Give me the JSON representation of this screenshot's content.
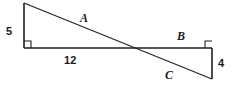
{
  "figure": {
    "type": "geometry-diagram",
    "background_color": "#ffffff",
    "stroke_color": "#231f20",
    "label_color": "#1a1a1a",
    "width": 237,
    "height": 88,
    "labels": {
      "leg_left": "5",
      "base": "12",
      "leg_right": "4",
      "side_a": "A",
      "side_b": "B",
      "side_c": "C"
    },
    "geometry": {
      "left_top": [
        24,
        3
      ],
      "left_bottom": [
        24,
        48
      ],
      "right_top": [
        212,
        48
      ],
      "right_bottom": [
        212,
        79
      ],
      "intersection": [
        128,
        48
      ],
      "baseline_y": 48,
      "right_angle_marker_size": 7
    }
  }
}
